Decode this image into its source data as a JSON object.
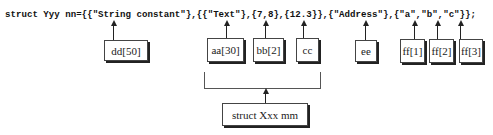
{
  "code_line": "struct Yyy nn={{\"String constant\"},{{\"Text\"},{7,8},{12.3}},{\"Address\"},{\"a\",\"b\",\"c\"}};",
  "members": [
    {
      "label": "dd[50]"
    },
    {
      "label": "aa[30]"
    },
    {
      "label": "bb[2]"
    },
    {
      "label": "cc"
    },
    {
      "label": "ee"
    },
    {
      "label": "ff[1]"
    },
    {
      "label": "ff[2]"
    },
    {
      "label": "ff[3]"
    }
  ],
  "nested_struct": {
    "label": "struct Xxx mm"
  }
}
